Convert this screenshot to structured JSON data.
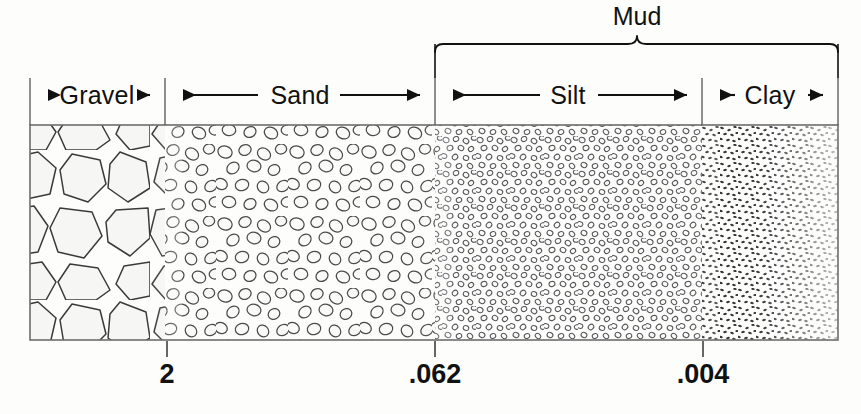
{
  "figure": {
    "title_group": "Mud",
    "background_color": "#fdfdfc",
    "ink_color": "#111111",
    "box": {
      "left": 30,
      "right": 838,
      "top": 125,
      "bottom": 340
    }
  },
  "group_brackets": [
    {
      "name": "mud-bracket",
      "label": "Mud",
      "label_x": 637,
      "label_y": 22,
      "left_x": 435,
      "right_x": 838,
      "y": 45,
      "peak_x": 637,
      "covers": [
        "Silt",
        "Clay"
      ]
    }
  ],
  "classes": [
    {
      "name": "gravel",
      "label": "Gravel",
      "left_x": 30,
      "right_x": 165,
      "label_x": 97,
      "texture": "large-angular-polygons"
    },
    {
      "name": "sand",
      "label": "Sand",
      "left_x": 165,
      "right_x": 435,
      "label_x": 300,
      "texture": "medium-rounded-grains"
    },
    {
      "name": "silt",
      "label": "Silt",
      "left_x": 435,
      "right_x": 702,
      "label_x": 568,
      "texture": "small-ring-grains"
    },
    {
      "name": "clay",
      "label": "Clay",
      "left_x": 702,
      "right_x": 838,
      "label_x": 770,
      "texture": "fine-dots"
    }
  ],
  "arrow_row": {
    "y": 95,
    "divider_top": 78,
    "divider_bottom": 125,
    "dividers_x": [
      30,
      165,
      435,
      702,
      838
    ]
  },
  "axis": {
    "y": 340,
    "tick_length": 16,
    "ticks": [
      {
        "name": "tick-2",
        "label": "2",
        "x": 167,
        "label_x": 167,
        "label_y": 383
      },
      {
        "name": "tick-062",
        "label": ".062",
        "x": 435,
        "label_x": 435,
        "label_y": 383
      },
      {
        "name": "tick-004",
        "label": ".004",
        "x": 703,
        "label_x": 703,
        "label_y": 383
      }
    ]
  }
}
